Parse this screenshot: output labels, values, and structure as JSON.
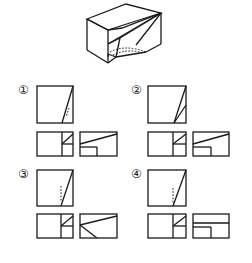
{
  "problem": {
    "type": "three-view drawing selection",
    "isometric_figure": "block with sloped triangular cut and hidden notch",
    "stroke_color": "#1a1a1a",
    "background": "#ffffff"
  },
  "options": [
    {
      "label": "①",
      "id": 1
    },
    {
      "label": "②",
      "id": 2
    },
    {
      "label": "③",
      "id": 3
    },
    {
      "label": "④",
      "id": 4
    }
  ]
}
